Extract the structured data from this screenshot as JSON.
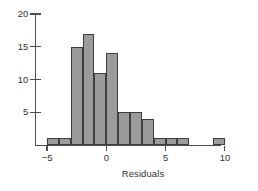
{
  "chart_data": {
    "type": "bar",
    "title": "",
    "subtitle": "",
    "xlabel": "Residuals",
    "ylabel": "",
    "xlim": [
      -5.8,
      10.8
    ],
    "ylim": [
      0,
      21
    ],
    "grid": false,
    "legend": "none",
    "bin_width": 1,
    "categories": [
      "-5 to -4",
      "-4 to -3",
      "-3 to -2",
      "-2 to -1",
      "-1 to 0",
      "0 to 1",
      "1 to 2",
      "2 to 3",
      "3 to 4",
      "4 to 5",
      "5 to 6",
      "6 to 7",
      "9 to 10"
    ],
    "bins": [
      {
        "lo": -5,
        "hi": -4,
        "count": 1
      },
      {
        "lo": -4,
        "hi": -3,
        "count": 1
      },
      {
        "lo": -3,
        "hi": -2,
        "count": 15
      },
      {
        "lo": -2,
        "hi": -1,
        "count": 17
      },
      {
        "lo": -1,
        "hi": 0,
        "count": 11
      },
      {
        "lo": 0,
        "hi": 1,
        "count": 14
      },
      {
        "lo": 1,
        "hi": 2,
        "count": 5
      },
      {
        "lo": 2,
        "hi": 3,
        "count": 5
      },
      {
        "lo": 3,
        "hi": 4,
        "count": 4
      },
      {
        "lo": 4,
        "hi": 5,
        "count": 1
      },
      {
        "lo": 5,
        "hi": 6,
        "count": 1
      },
      {
        "lo": 6,
        "hi": 7,
        "count": 1
      },
      {
        "lo": 9,
        "hi": 10,
        "count": 1
      }
    ],
    "values": [
      1,
      1,
      15,
      17,
      11,
      14,
      5,
      5,
      4,
      1,
      1,
      1,
      1
    ],
    "x_ticks": [
      -5,
      0,
      5,
      10
    ],
    "x_tick_labels": [
      "−5",
      "0",
      "5",
      "10"
    ],
    "y_ticks": [
      5,
      10,
      15,
      20
    ],
    "y_tick_labels": [
      "5",
      "10",
      "15",
      "20"
    ],
    "colors": {
      "bar_fill": "#9b9b9b",
      "bar_stroke": "#3d3d3d",
      "axis": "#4d4d4d",
      "text": "#333333",
      "background": "#ffffff"
    }
  }
}
